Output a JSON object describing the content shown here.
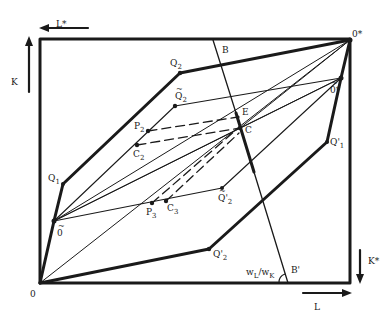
{
  "diagram": {
    "colors": {
      "ink": "#1a1a1a",
      "background": "#ffffff"
    },
    "axes": {
      "K": "K",
      "L": "L",
      "K_star": "K*",
      "L_star": "L*"
    },
    "origins": {
      "O": "0",
      "O_star": "0*",
      "O_tilde": "0",
      "O_tilde_star": "0*"
    },
    "points": {
      "Q1": {
        "base": "Q",
        "sub": "1"
      },
      "Q2": {
        "base": "Q",
        "sub": "2"
      },
      "Q1_prime": {
        "base": "Q'",
        "sub": "1"
      },
      "Q2_prime": {
        "base": "Q'",
        "sub": "2"
      },
      "Q2_tilde": {
        "base": "Q",
        "sub": "2"
      },
      "Q2_tilde_prime": {
        "base": "Q'",
        "sub": "2"
      },
      "P2": {
        "base": "P",
        "sub": "2"
      },
      "P3": {
        "base": "P",
        "sub": "3"
      },
      "C2": {
        "base": "C",
        "sub": "2"
      },
      "C3": {
        "base": "C",
        "sub": "3"
      },
      "E": "E",
      "C": "C",
      "B": "B",
      "B_prime": "B'"
    },
    "slope_label": {
      "num": "w",
      "num_sub": "L",
      "sep": "/w",
      "den_sub": "K"
    },
    "tilde": "~"
  }
}
